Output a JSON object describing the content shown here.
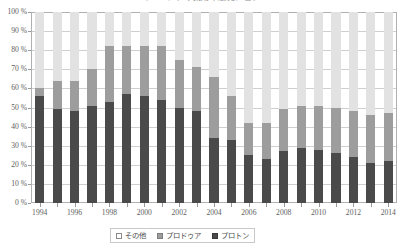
{
  "chart_data": {
    "type": "bar",
    "stacked": true,
    "stack_mode": "percent",
    "title": "マレーシアの乗用車販売シェア",
    "xlabel": "",
    "ylabel": "",
    "ylim": [
      0,
      100
    ],
    "ytick_labels": [
      "0 %",
      "10 %",
      "20 %",
      "30 %",
      "40 %",
      "50 %",
      "60 %",
      "70 %",
      "80 %",
      "90 %",
      "100 %"
    ],
    "ytick_values": [
      0,
      10,
      20,
      30,
      40,
      50,
      60,
      70,
      80,
      90,
      100
    ],
    "grid": true,
    "legend_position": "bottom",
    "categories": [
      "1994",
      "1995",
      "1996",
      "1997",
      "1998",
      "1999",
      "2000",
      "2001",
      "2002",
      "2003",
      "2004",
      "2005",
      "2006",
      "2007",
      "2008",
      "2009",
      "2010",
      "2011",
      "2012",
      "2013",
      "2014"
    ],
    "xtick_labels": [
      "1994",
      "1996",
      "1998",
      "2000",
      "2002",
      "2004",
      "2006",
      "2008",
      "2010",
      "2012",
      "2014"
    ],
    "series": [
      {
        "name": "プロトン",
        "color": "#4a4a4a",
        "values": [
          56,
          49,
          48,
          51,
          53,
          57,
          56,
          54,
          50,
          48,
          34,
          33,
          25,
          23,
          27,
          29,
          28,
          26,
          24,
          21,
          22
        ]
      },
      {
        "name": "プロドゥア",
        "color": "#9d9d9d",
        "values": [
          4,
          15,
          16,
          19,
          29,
          25,
          26,
          28,
          25,
          23,
          32,
          23,
          17,
          19,
          22,
          22,
          23,
          24,
          24,
          25,
          25
        ]
      },
      {
        "name": "その他",
        "color": "#e2e2e2",
        "values": [
          40,
          36,
          36,
          30,
          18,
          18,
          18,
          18,
          25,
          29,
          34,
          44,
          58,
          58,
          51,
          49,
          49,
          50,
          52,
          54,
          53
        ]
      }
    ]
  },
  "legend": {
    "items": [
      {
        "key": "other",
        "label": "その他"
      },
      {
        "key": "perodua",
        "label": "プロドゥア"
      },
      {
        "key": "proton",
        "label": "プロトン"
      }
    ]
  }
}
